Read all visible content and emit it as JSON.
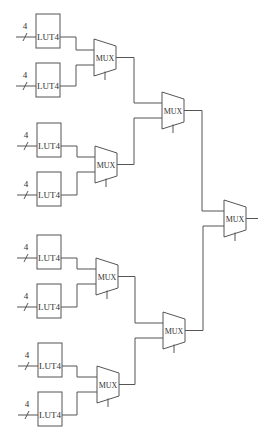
{
  "diagram": {
    "type": "mux-tree",
    "lut_label": "LUT4",
    "mux_label": "MUX",
    "bus_width_label": "4",
    "luts": [
      {
        "id": "lut-1",
        "label": "LUT4",
        "input_width": "4",
        "x": 36,
        "y": 14
      },
      {
        "id": "lut-2",
        "label": "LUT4",
        "input_width": "4",
        "x": 36,
        "y": 63
      },
      {
        "id": "lut-3",
        "label": "LUT4",
        "input_width": "4",
        "x": 37,
        "y": 123
      },
      {
        "id": "lut-4",
        "label": "LUT4",
        "input_width": "4",
        "x": 37,
        "y": 172
      },
      {
        "id": "lut-5",
        "label": "LUT4",
        "input_width": "4",
        "x": 37,
        "y": 235
      },
      {
        "id": "lut-6",
        "label": "LUT4",
        "input_width": "4",
        "x": 37,
        "y": 284
      },
      {
        "id": "lut-7",
        "label": "LUT4",
        "input_width": "4",
        "x": 38,
        "y": 343
      },
      {
        "id": "lut-8",
        "label": "LUT4",
        "input_width": "4",
        "x": 38,
        "y": 392
      }
    ],
    "muxes": [
      {
        "id": "mux-l1-1",
        "label": "MUX",
        "x": 94,
        "y": 39
      },
      {
        "id": "mux-l1-2",
        "label": "MUX",
        "x": 95,
        "y": 146
      },
      {
        "id": "mux-l1-3",
        "label": "MUX",
        "x": 96,
        "y": 258
      },
      {
        "id": "mux-l1-4",
        "label": "MUX",
        "x": 97,
        "y": 366
      },
      {
        "id": "mux-l2-1",
        "label": "MUX",
        "x": 162,
        "y": 92
      },
      {
        "id": "mux-l2-2",
        "label": "MUX",
        "x": 163,
        "y": 312
      },
      {
        "id": "mux-l3-1",
        "label": "MUX",
        "x": 224,
        "y": 200
      }
    ]
  }
}
